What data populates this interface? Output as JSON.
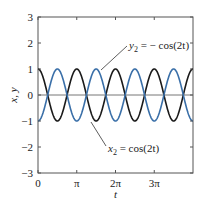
{
  "chart_data": {
    "type": "line",
    "title": "",
    "xlabel": "t",
    "ylabel": "x, y",
    "xlim": [
      0,
      12.566
    ],
    "ylim": [
      -3,
      3
    ],
    "grid": false,
    "x_ticks": [
      {
        "value": 0,
        "label": "0"
      },
      {
        "value": 3.1416,
        "label": "π"
      },
      {
        "value": 6.2832,
        "label": "2π"
      },
      {
        "value": 9.4248,
        "label": "3π"
      }
    ],
    "y_ticks": [
      {
        "value": 3,
        "label": "3"
      },
      {
        "value": 2,
        "label": "2"
      },
      {
        "value": 1,
        "label": "1"
      },
      {
        "value": 0,
        "label": "0"
      },
      {
        "value": -1,
        "label": "−1"
      },
      {
        "value": -2,
        "label": "−2"
      },
      {
        "value": -3,
        "label": "−3"
      }
    ],
    "series": [
      {
        "name": "x2 = cos(2t)",
        "formula": "cos(2t)",
        "color": "#1a1a1a",
        "x": [
          0,
          0.785,
          1.571,
          2.356,
          3.142,
          3.927,
          4.712,
          5.498,
          6.283,
          7.069,
          7.854,
          8.639,
          9.425,
          10.21,
          10.996,
          11.781,
          12.566
        ],
        "values": [
          1,
          0,
          -1,
          0,
          1,
          0,
          -1,
          0,
          1,
          0,
          -1,
          0,
          1,
          0,
          -1,
          0,
          1
        ]
      },
      {
        "name": "y2 = −cos(2t)",
        "formula": "-cos(2t)",
        "color": "#3a6fa8",
        "x": [
          0,
          0.785,
          1.571,
          2.356,
          3.142,
          3.927,
          4.712,
          5.498,
          6.283,
          7.069,
          7.854,
          8.639,
          9.425,
          10.21,
          10.996,
          11.781,
          12.566
        ],
        "values": [
          -1,
          0,
          1,
          0,
          -1,
          0,
          1,
          0,
          -1,
          0,
          1,
          0,
          -1,
          0,
          1,
          0,
          -1
        ]
      }
    ],
    "reference_lines": [
      {
        "axis": "y",
        "value": 0,
        "color": "#777777"
      }
    ],
    "annotations": [
      {
        "text_main": "y",
        "text_sub": "2",
        "text_rest": " = − cos(2t)",
        "target_series": "y2 = −cos(2t)"
      },
      {
        "text_main": "x",
        "text_sub": "2",
        "text_rest": " = cos(2t)",
        "target_series": "x2 = cos(2t)"
      }
    ]
  }
}
